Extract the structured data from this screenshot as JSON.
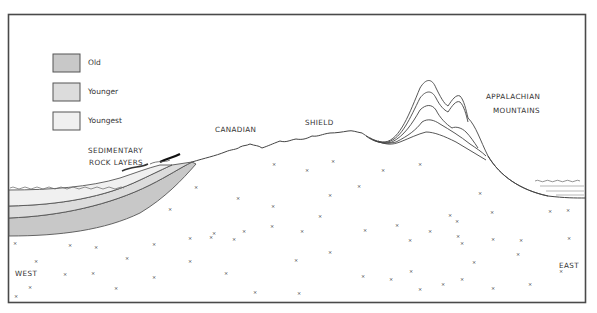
{
  "legend": {
    "items": [
      {
        "label": "Old",
        "color": "#c8c8c8"
      },
      {
        "label": "Younger",
        "color": "#dcdcdc"
      },
      {
        "label": "Youngest",
        "color": "#f0f0f0"
      }
    ]
  },
  "labels": {
    "sedimentary_line1": "SEDIMENTARY",
    "sedimentary_line2": "ROCK LAYERS",
    "canadian": "CANADIAN",
    "shield": "SHIELD",
    "appalachian_line1": "APPALACHIAN",
    "appalachian_line2": "MOUNTAINS",
    "west": "WEST",
    "east": "EAST"
  },
  "colors": {
    "frame": "#4a4a4a",
    "line": "#555555",
    "bedrock_mark": "#777777"
  }
}
